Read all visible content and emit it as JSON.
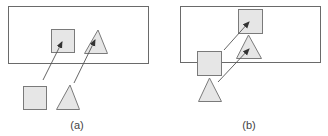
{
  "diagram": {
    "panels": [
      {
        "id": "a",
        "label": "(a)",
        "container": {
          "x": 8,
          "y": 6,
          "w": 140,
          "h": 57
        },
        "shapes": [
          {
            "type": "square",
            "role": "target",
            "x": 51,
            "y": 29,
            "size": 23
          },
          {
            "type": "triangle",
            "role": "target",
            "points": "98,30 84,53 107,53"
          },
          {
            "type": "square",
            "role": "source",
            "x": 23,
            "y": 86,
            "size": 23
          },
          {
            "type": "triangle",
            "role": "source",
            "points": "70,85 56,109 79,109"
          }
        ],
        "arrows": [
          {
            "from": [
              43,
              80
            ],
            "to": [
              62,
              42
            ]
          },
          {
            "from": [
              74,
              83
            ],
            "to": [
              95,
              40
            ]
          }
        ]
      },
      {
        "id": "b",
        "label": "(b)",
        "container": {
          "x": 180,
          "y": 6,
          "w": 140,
          "h": 56
        },
        "shapes": [
          {
            "type": "square",
            "role": "target",
            "x": 238,
            "y": 9,
            "size": 24
          },
          {
            "type": "triangle",
            "role": "target",
            "points": "248,35 236,58 261,58"
          },
          {
            "type": "square",
            "role": "source",
            "x": 197,
            "y": 51,
            "size": 24
          },
          {
            "type": "triangle",
            "role": "source",
            "points": "209,78 198,101 221,101"
          }
        ],
        "arrows": [
          {
            "from": [
              224,
              50
            ],
            "to": [
              249,
              22
            ]
          },
          {
            "from": [
              218,
              82
            ],
            "to": [
              249,
              49
            ]
          }
        ]
      }
    ],
    "colors": {
      "shape_fill": "#e6e6e6",
      "shape_stroke": "#7a7a7a",
      "frame_stroke": "#6a6a6a",
      "arrow": "#555555"
    }
  }
}
